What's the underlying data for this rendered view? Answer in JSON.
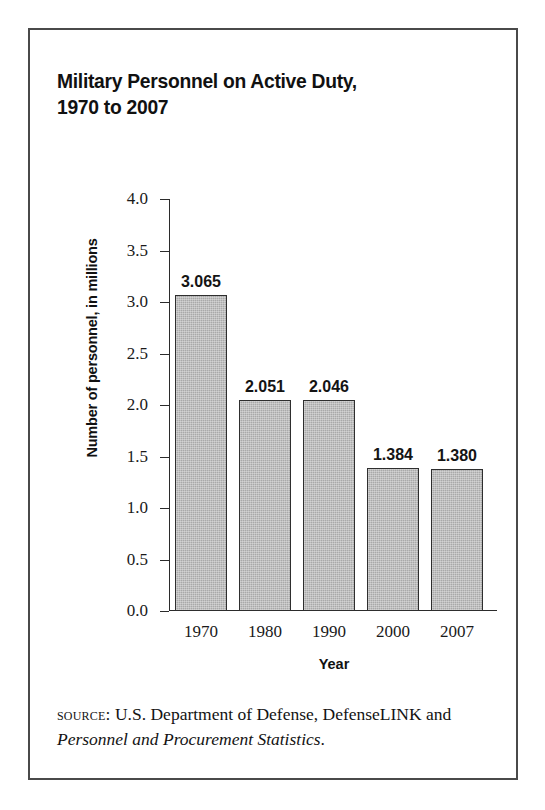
{
  "figure": {
    "title": "Military Personnel on Active Duty,\n1970 to 2007",
    "source_label": "source:",
    "source_text_before": " U.S. Department of Defense, DefenseLINK and ",
    "source_italic": "Personnel and Procurement Statistics",
    "source_text_after": "."
  },
  "chart_data": {
    "type": "bar",
    "title": "Military Personnel on Active Duty, 1970 to 2007",
    "xlabel": "Year",
    "ylabel": "Number of personnel, in millions",
    "categories": [
      "1970",
      "1980",
      "1990",
      "2000",
      "2007"
    ],
    "values": [
      3.065,
      2.051,
      2.046,
      1.384,
      1.38
    ],
    "value_labels": [
      "3.065",
      "2.051",
      "2.046",
      "1.384",
      "1.380"
    ],
    "ylim": [
      0.0,
      4.0
    ],
    "ytick_labels": [
      "4.0",
      "3.5",
      "3.0",
      "2.5",
      "2.0",
      "1.5",
      "1.0",
      "0.5",
      "0.0"
    ],
    "ytick_values": [
      4.0,
      3.5,
      3.0,
      2.5,
      2.0,
      1.5,
      1.0,
      0.5,
      0.0
    ],
    "grid": false,
    "legend": false,
    "bar_fill_color": "#a9a9a9",
    "bar_edge_color": "#2e2e2e",
    "axis_color": "#2b2b2b",
    "text_color": "#131313",
    "background_color": "#ffffff",
    "frame_color": "#4a4a4a"
  }
}
